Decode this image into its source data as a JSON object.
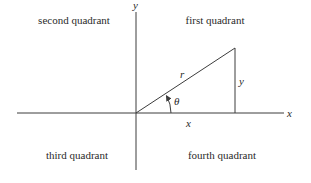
{
  "diagram": {
    "title": "",
    "axes": {
      "x_label": "x",
      "y_label": "y"
    },
    "quadrants": {
      "first": "first quadrant",
      "second": "second quadrant",
      "third": "third quadrant",
      "fourth": "fourth quadrant"
    },
    "triangle": {
      "hypotenuse_label": "r",
      "opposite_label": "y",
      "adjacent_label": "x",
      "angle_label": "θ"
    },
    "colors": {
      "stroke": "#3c3c3c",
      "text": "#2a2a2a",
      "background": "#ffffff"
    }
  }
}
